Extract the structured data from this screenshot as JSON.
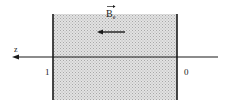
{
  "diagram": {
    "field_label": "B",
    "field_subscript": "e",
    "axis_label": "z",
    "left_boundary_label": "1",
    "right_boundary_label": "0",
    "field_direction": "left",
    "colors": {
      "line": "#1a1a1a",
      "shading": "#d4d4d4",
      "background": "#ffffff"
    }
  }
}
